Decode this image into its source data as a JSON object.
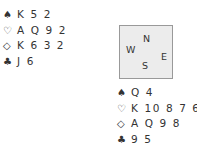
{
  "north": {
    "spades": {
      "symbol": "♠",
      "cards": "K 5 2"
    },
    "hearts": {
      "symbol": "♡",
      "cards": "A Q 9 2"
    },
    "diamonds": {
      "symbol": "◇",
      "cards": "K 6 3 2"
    },
    "clubs": {
      "symbol": "♣",
      "cards": "J 6"
    }
  },
  "compass": {
    "n": "N",
    "w": "W",
    "e": "E",
    "s": "S"
  },
  "south": {
    "spades": {
      "symbol": "♠",
      "cards": "Q 4"
    },
    "hearts": {
      "symbol": "♡",
      "cards": "K 10 8 7 6"
    },
    "diamonds": {
      "symbol": "◇",
      "cards": "A Q 9 8"
    },
    "clubs": {
      "symbol": "♣",
      "cards": "9 5"
    }
  }
}
